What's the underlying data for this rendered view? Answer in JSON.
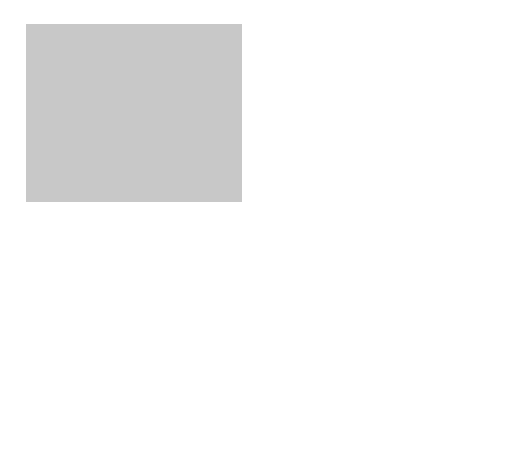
{
  "figure": {
    "domain_label": "𝒟",
    "domain_sup": "∞",
    "domain_params": "{ϵ₀, μ₀}",
    "state_label": "State (B)",
    "testing_source_label": "Testing source",
    "current_label": "I",
    "current_sub": "n",
    "current_sup": "B",
    "current_arg": "(t)",
    "surface_inner": "𝒮",
    "surface_inner_sub": "1",
    "surface_outer": "𝒮",
    "surface_outer_sub": "0",
    "region_label": "𝒜",
    "normal_label_inner": "ν",
    "normal_label_outer": "ν",
    "origin_label": "𝒪",
    "axis_1": "i",
    "axis_1_sub": "1",
    "axis_2": "i",
    "axis_2_sub": "2",
    "axis_3": "i",
    "axis_3_sub": "3"
  },
  "colors": {
    "background": "#c8c8c8",
    "annulus": "#8f8f8f",
    "inner_disk": "#e4e4e4",
    "stroke": "#2a2a2a",
    "arrow_accent": "#6a6a6a"
  }
}
